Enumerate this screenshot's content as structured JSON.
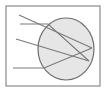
{
  "diagram": {
    "colors": {
      "background": "#ffffff",
      "frame": "#8a8a8a",
      "ellipse_fill": "#e6e6e6",
      "ellipse_stroke": "#6e6e6e",
      "line": "#7a7a7a"
    },
    "frame": {
      "x": 6,
      "y": 6,
      "width": 94,
      "height": 80
    },
    "ellipse": {
      "cx": 66,
      "cy": 49,
      "rx": 28,
      "ry": 31
    },
    "lines": [
      {
        "id": "ray-1",
        "points": "19,15 92,48"
      },
      {
        "id": "ray-2",
        "points": "20,24 48,24 89,61"
      },
      {
        "id": "ray-3",
        "points": "16,39 89,61"
      },
      {
        "id": "ray-4",
        "points": "13,68 44,68 92,48"
      }
    ]
  }
}
